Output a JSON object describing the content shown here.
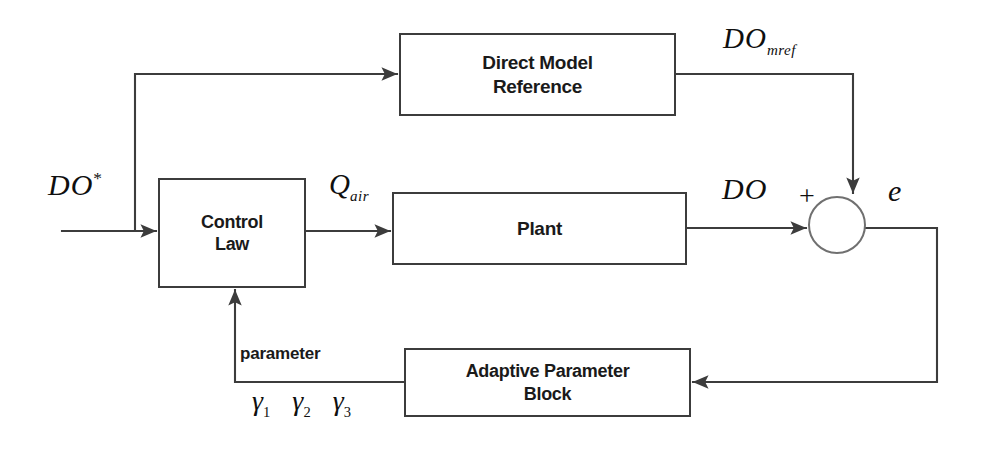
{
  "diagram": {
    "line_color": "#3c3c3c",
    "text_color": "#1a1a1a",
    "background": "#ffffff"
  },
  "blocks": [
    {
      "id": "direct-model-reference",
      "label": "Direct Model\nReference"
    },
    {
      "id": "control-law",
      "label": "Control\nLaw"
    },
    {
      "id": "plant",
      "label": "Plant"
    },
    {
      "id": "adaptive-parameter-block",
      "label": "Adaptive Parameter\nBlock"
    }
  ],
  "signals": {
    "setpoint": {
      "base": "DO",
      "sup": "*"
    },
    "model_reference_output": {
      "base": "DO",
      "sub": "mref"
    },
    "control_output": {
      "base": "Q",
      "sub": "air"
    },
    "plant_output": {
      "base": "DO"
    },
    "error": {
      "base": "e"
    },
    "sum_sign": "+",
    "parameter_label": "parameter"
  },
  "gammas": [
    {
      "base": "γ",
      "sub": "1"
    },
    {
      "base": "γ",
      "sub": "2"
    },
    {
      "base": "γ",
      "sub": "3"
    }
  ],
  "summing_junction": {
    "shape": "circle",
    "sign": "+"
  }
}
